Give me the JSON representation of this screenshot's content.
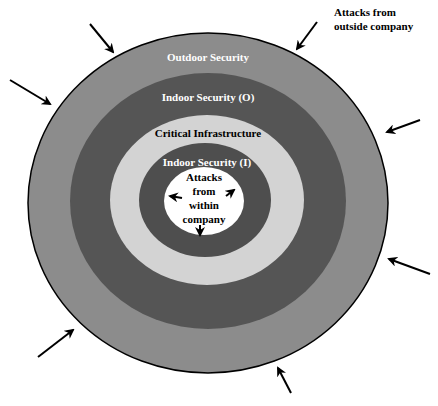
{
  "diagram": {
    "rings": [
      {
        "id": "outdoor",
        "label": "Outdoor Security",
        "color": "#8c8c8c"
      },
      {
        "id": "indoor-o",
        "label": "Indoor Security (O)",
        "color": "#555555"
      },
      {
        "id": "critical",
        "label": "Critical Infrastructure",
        "color": "#d3d3d3"
      },
      {
        "id": "indoor-i",
        "label": "Indoor Security (I)",
        "color": "#4e4e4e"
      },
      {
        "id": "core",
        "label": "Attacks from within company",
        "color": "#ffffff"
      }
    ],
    "core_lines": [
      "Attacks",
      "from",
      "within",
      "company"
    ],
    "outside_label_lines": [
      "Attacks from",
      "outside company"
    ],
    "outside_arrow_count": 7,
    "inside_arrow_count": 3
  }
}
